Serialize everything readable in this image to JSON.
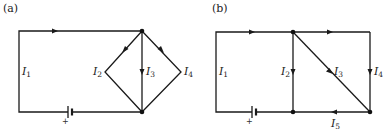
{
  "figure": {
    "panels": [
      {
        "id": "a",
        "caption": "(a)",
        "currents": [
          {
            "symbol": "I",
            "sub": "1"
          },
          {
            "symbol": "I",
            "sub": "2"
          },
          {
            "symbol": "I",
            "sub": "3"
          },
          {
            "symbol": "I",
            "sub": "4"
          }
        ],
        "battery_polarity": "+"
      },
      {
        "id": "b",
        "caption": "(b)",
        "currents": [
          {
            "symbol": "I",
            "sub": "1"
          },
          {
            "symbol": "I",
            "sub": "2"
          },
          {
            "symbol": "I",
            "sub": "3"
          },
          {
            "symbol": "I",
            "sub": "4"
          },
          {
            "symbol": "I",
            "sub": "5"
          }
        ],
        "battery_polarity": "+"
      }
    ],
    "colors": {
      "wire": "#1a1a1a",
      "background": "#ffffff"
    }
  }
}
